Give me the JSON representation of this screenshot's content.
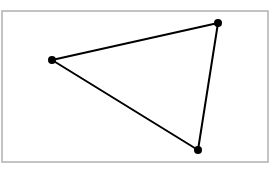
{
  "diagram": {
    "type": "triangle",
    "frame": {
      "x": 2,
      "y": 11,
      "width": 266,
      "height": 151,
      "stroke": "#b0b0b0"
    },
    "edge_color": "#000000",
    "vertex_color": "#000000",
    "vertices": [
      {
        "id": "A",
        "x": 52,
        "y": 60
      },
      {
        "id": "B",
        "x": 218,
        "y": 23
      },
      {
        "id": "C",
        "x": 198,
        "y": 150
      }
    ],
    "edges": [
      {
        "from": "A",
        "to": "B"
      },
      {
        "from": "B",
        "to": "C"
      },
      {
        "from": "C",
        "to": "A"
      }
    ]
  }
}
